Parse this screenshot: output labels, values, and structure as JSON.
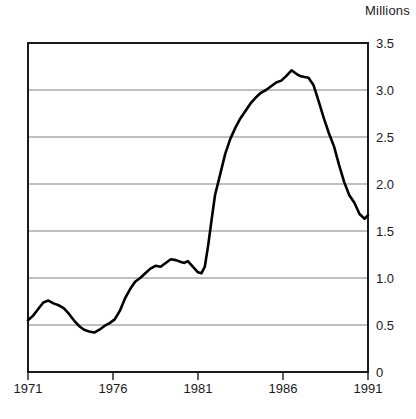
{
  "chart_data": {
    "type": "line",
    "title": "",
    "unit_label": "Millions",
    "xlabel": "",
    "ylabel": "Millions",
    "xlim": [
      1971,
      1991
    ],
    "ylim": [
      0,
      3.5
    ],
    "grid": "horizontal",
    "legend": "none",
    "line_color": "#000000",
    "grid_color": "#808080",
    "axis_color": "#1a1a1a",
    "background": "#ffffff",
    "xticks": [
      "1971",
      "1976",
      "1981",
      "1986",
      "1991"
    ],
    "xtick_values": [
      1971,
      1976,
      1981,
      1986,
      1991
    ],
    "yticks": [
      "0",
      "0.5",
      "1.0",
      "1.5",
      "2.0",
      "2.5",
      "3.0",
      "3.5"
    ],
    "ytick_values": [
      0,
      0.5,
      1.0,
      1.5,
      2.0,
      2.5,
      3.0,
      3.5
    ],
    "series": [
      {
        "name": "Value",
        "x": [
          1971.0,
          1971.3,
          1971.6,
          1971.9,
          1972.2,
          1972.5,
          1972.8,
          1973.1,
          1973.4,
          1973.7,
          1974.0,
          1974.3,
          1974.6,
          1974.9,
          1975.2,
          1975.5,
          1975.8,
          1976.1,
          1976.4,
          1976.7,
          1977.0,
          1977.3,
          1977.6,
          1977.9,
          1978.2,
          1978.5,
          1978.8,
          1979.1,
          1979.4,
          1979.7,
          1980.0,
          1980.2,
          1980.4,
          1980.6,
          1980.8,
          1981.0,
          1981.2,
          1981.4,
          1981.6,
          1981.8,
          1982.0,
          1982.3,
          1982.6,
          1982.9,
          1983.2,
          1983.5,
          1983.8,
          1984.1,
          1984.4,
          1984.7,
          1985.0,
          1985.3,
          1985.6,
          1985.9,
          1986.2,
          1986.5,
          1986.8,
          1987.0,
          1987.2,
          1987.5,
          1987.8,
          1988.1,
          1988.4,
          1988.7,
          1989.0,
          1989.3,
          1989.6,
          1989.9,
          1990.2,
          1990.5,
          1990.8,
          1991.0
        ],
        "y": [
          0.55,
          0.6,
          0.67,
          0.74,
          0.76,
          0.73,
          0.71,
          0.68,
          0.62,
          0.55,
          0.49,
          0.45,
          0.43,
          0.42,
          0.45,
          0.49,
          0.52,
          0.56,
          0.65,
          0.78,
          0.88,
          0.96,
          1.0,
          1.05,
          1.1,
          1.13,
          1.12,
          1.16,
          1.2,
          1.19,
          1.17,
          1.16,
          1.18,
          1.14,
          1.1,
          1.06,
          1.05,
          1.12,
          1.35,
          1.62,
          1.88,
          2.1,
          2.32,
          2.48,
          2.6,
          2.7,
          2.78,
          2.86,
          2.92,
          2.97,
          3.0,
          3.04,
          3.08,
          3.1,
          3.15,
          3.21,
          3.17,
          3.15,
          3.14,
          3.13,
          3.05,
          2.88,
          2.7,
          2.54,
          2.4,
          2.2,
          2.02,
          1.88,
          1.8,
          1.68,
          1.63,
          1.67
        ]
      }
    ],
    "annotations": {
      "start_value": 0.55,
      "first_peak": 0.76,
      "trough": 0.42,
      "plateau_level": 1.2,
      "pre_surge_dip": 1.05,
      "max_value": 3.21,
      "max_year": 1986.5,
      "end_value": 1.67
    }
  },
  "axes_geometry": {
    "plot_left": 28,
    "plot_right": 368,
    "plot_top": 43,
    "plot_bottom": 372
  }
}
